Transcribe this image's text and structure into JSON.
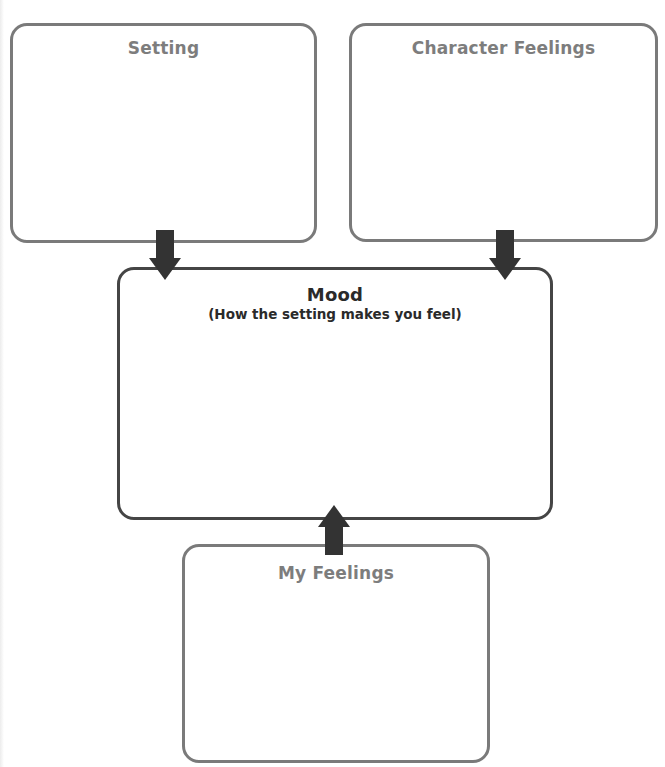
{
  "organizer": {
    "boxes": {
      "setting": {
        "title": "Setting"
      },
      "character_feelings": {
        "title": "Character Feelings"
      },
      "mood": {
        "title": "Mood",
        "subtitle": "(How the setting makes you feel)"
      },
      "my_feelings": {
        "title": "My Feelings"
      }
    },
    "arrows": [
      {
        "from": "Setting",
        "to": "Mood",
        "direction": "down"
      },
      {
        "from": "Character Feelings",
        "to": "Mood",
        "direction": "down"
      },
      {
        "from": "My Feelings",
        "to": "Mood",
        "direction": "up"
      }
    ],
    "colors": {
      "box_border": "#7a7a7a",
      "mood_border": "#454545",
      "arrow_fill": "#333333",
      "title_gray": "#7d7d7d",
      "title_dark": "#2a2a2a"
    }
  }
}
